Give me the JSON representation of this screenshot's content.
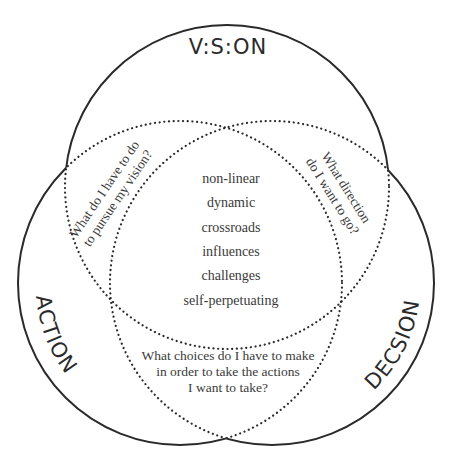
{
  "diagram": {
    "type": "venn",
    "circles": {
      "vision": {
        "label": "V:S:ON",
        "cx": 227,
        "cy": 187,
        "r": 162
      },
      "action": {
        "label": "ACTION",
        "cx": 180,
        "cy": 283,
        "r": 162
      },
      "decision": {
        "label": "DECSION",
        "cx": 272,
        "cy": 283,
        "r": 162
      }
    },
    "center_words": [
      "non-linear",
      "dynamic",
      "crossroads",
      "influences",
      "challenges",
      "self-perpetuating"
    ],
    "questions": {
      "vision_action": [
        "What do I have to do",
        "to pursue my vision?"
      ],
      "vision_decision": [
        "What direction",
        "do I want to go?"
      ],
      "action_decision": [
        "What choices do I have to make",
        "in order to take the actions",
        "I want to take?"
      ]
    },
    "colors": {
      "stroke": "#2a2a2a",
      "text": "#3a3a3a",
      "background": "#ffffff"
    }
  }
}
